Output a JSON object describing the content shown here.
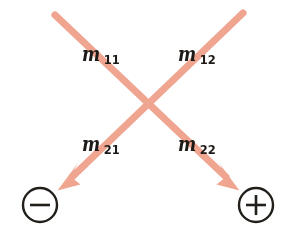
{
  "figure": {
    "background_color": "#ffffff",
    "arrow_color": "#f0a590",
    "label_color": "#1d1a17",
    "terminal_color": "#1d1a17",
    "labels": [
      {
        "id": "m11",
        "base": "m",
        "subscript": "11",
        "name": "label-m11"
      },
      {
        "id": "m12",
        "base": "m",
        "subscript": "12",
        "name": "label-m12"
      },
      {
        "id": "m21",
        "base": "m",
        "subscript": "21",
        "name": "label-m21"
      },
      {
        "id": "m22",
        "base": "m",
        "subscript": "22",
        "name": "label-m22"
      }
    ],
    "arrows": [
      {
        "id": "arrow-top-left-to-bottom-right",
        "from": [
          55,
          15
        ],
        "to": [
          240,
          190
        ],
        "direction": "down-right",
        "target": "plus"
      },
      {
        "id": "arrow-top-right-to-bottom-left",
        "from": [
          243,
          13
        ],
        "to": [
          58,
          190
        ],
        "direction": "down-left",
        "target": "minus"
      }
    ],
    "terminals": [
      {
        "id": "minus-terminal",
        "symbol": "minus",
        "center": [
          40,
          205
        ],
        "radius": 17
      },
      {
        "id": "plus-terminal",
        "symbol": "plus",
        "center": [
          256,
          205
        ],
        "radius": 17
      }
    ]
  }
}
